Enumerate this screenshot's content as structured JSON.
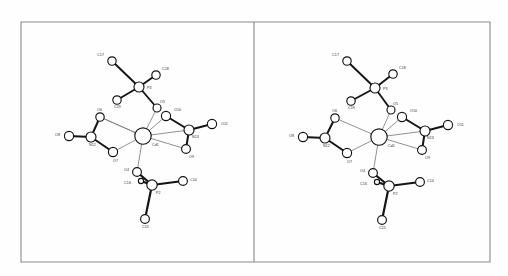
{
  "figure": {
    "kind": "ortep-stereo-pair",
    "title": "",
    "caption": "",
    "background_color": "#fefefe",
    "frame": {
      "stroke_color": "#8a8a8a",
      "x": 21,
      "y": 22,
      "width": 469,
      "height": 240,
      "divider_x": 254
    }
  },
  "chart_data": {
    "type": "diagram",
    "title": "",
    "xlabel": "",
    "ylabel": "",
    "panels": [
      {
        "name": "left-stereo-view",
        "offset_x": 0,
        "atoms": [
          {
            "label": "C17",
            "x": 112,
            "y": 61,
            "r": 4.2,
            "label_dx": -8,
            "label_dy": -5
          },
          {
            "label": "C18",
            "x": 156,
            "y": 75,
            "r": 4.2,
            "label_dx": 6,
            "label_dy": -5
          },
          {
            "label": "C19",
            "x": 117,
            "y": 100,
            "r": 4.2,
            "label_dx": -3,
            "label_dy": 8
          },
          {
            "label": "P3",
            "x": 139,
            "y": 87,
            "r": 5.0,
            "label_dx": 8,
            "label_dy": 2
          },
          {
            "label": "O5",
            "x": 157,
            "y": 108,
            "r": 4.0,
            "label_dx": 3,
            "label_dy": -5
          },
          {
            "label": "O10",
            "x": 166,
            "y": 116,
            "r": 4.6,
            "label_dx": 8,
            "label_dy": -5
          },
          {
            "label": "O11",
            "x": 212,
            "y": 124,
            "r": 4.6,
            "label_dx": 9,
            "label_dy": 1
          },
          {
            "label": "N13",
            "x": 189,
            "y": 130,
            "r": 5.0,
            "label_dx": 3,
            "label_dy": 8
          },
          {
            "label": "O9",
            "x": 186,
            "y": 149,
            "r": 4.4,
            "label_dx": 3,
            "label_dy": 9
          },
          {
            "label": "Cd1",
            "x": 143,
            "y": 136,
            "r": 8.2,
            "label_dx": 9,
            "label_dy": 10
          },
          {
            "label": "O6",
            "x": 100,
            "y": 117,
            "r": 4.2,
            "label_dx": -3,
            "label_dy": -6
          },
          {
            "label": "O8",
            "x": 69,
            "y": 136,
            "r": 4.6,
            "label_dx": -9,
            "label_dy": 0
          },
          {
            "label": "N12",
            "x": 91,
            "y": 137,
            "r": 5.0,
            "label_dx": -2,
            "label_dy": 9
          },
          {
            "label": "O7",
            "x": 113,
            "y": 152,
            "r": 4.6,
            "label_dx": 0,
            "label_dy": 10
          },
          {
            "label": "O4",
            "x": 137,
            "y": 172,
            "r": 4.4,
            "label_dx": -8,
            "label_dy": -1
          },
          {
            "label": "C16",
            "x": 141,
            "y": 181,
            "r": 2.6,
            "label_dx": -10,
            "label_dy": 3
          },
          {
            "label": "P2",
            "x": 152,
            "y": 185,
            "r": 5.2,
            "label_dx": 4,
            "label_dy": 9
          },
          {
            "label": "C14",
            "x": 183,
            "y": 181,
            "r": 4.4,
            "label_dx": 7,
            "label_dy": 0
          },
          {
            "label": "C15",
            "x": 145,
            "y": 219,
            "r": 4.4,
            "label_dx": -3,
            "label_dy": 9
          }
        ],
        "bonds_thick": [
          {
            "a": "C17",
            "b": "P3",
            "w": 1.9
          },
          {
            "a": "C18",
            "b": "P3",
            "w": 1.9
          },
          {
            "a": "C19",
            "b": "P3",
            "w": 1.9
          },
          {
            "a": "P3",
            "b": "O5",
            "w": 1.9
          },
          {
            "a": "O10",
            "b": "N13",
            "w": 2.0
          },
          {
            "a": "N13",
            "b": "O11",
            "w": 2.0
          },
          {
            "a": "N13",
            "b": "O9",
            "w": 2.0
          },
          {
            "a": "O8",
            "b": "N12",
            "w": 2.0
          },
          {
            "a": "N12",
            "b": "O6",
            "w": 2.0
          },
          {
            "a": "N12",
            "b": "O7",
            "w": 2.0
          },
          {
            "a": "O4",
            "b": "P2",
            "w": 2.2
          },
          {
            "a": "C16",
            "b": "P2",
            "w": 2.2
          },
          {
            "a": "P2",
            "b": "C14",
            "w": 2.2
          },
          {
            "a": "P2",
            "b": "C15",
            "w": 2.2
          }
        ],
        "bonds_thin": [
          {
            "a": "Cd1",
            "b": "O5"
          },
          {
            "a": "Cd1",
            "b": "O10"
          },
          {
            "a": "Cd1",
            "b": "N13"
          },
          {
            "a": "Cd1",
            "b": "O9"
          },
          {
            "a": "Cd1",
            "b": "O6"
          },
          {
            "a": "Cd1",
            "b": "O7"
          },
          {
            "a": "Cd1",
            "b": "O4"
          },
          {
            "a": "O6",
            "b": "Cd1"
          }
        ]
      },
      {
        "name": "right-stereo-view",
        "offset_x": 235,
        "atoms": [
          {
            "label": "C17",
            "x": 112,
            "y": 61,
            "r": 4.2,
            "label_dx": -8,
            "label_dy": -5
          },
          {
            "label": "C18",
            "x": 158,
            "y": 74,
            "r": 4.2,
            "label_dx": 6,
            "label_dy": -5
          },
          {
            "label": "C19",
            "x": 116,
            "y": 101,
            "r": 4.2,
            "label_dx": -3,
            "label_dy": 8
          },
          {
            "label": "P3",
            "x": 140,
            "y": 88,
            "r": 5.0,
            "label_dx": 8,
            "label_dy": 2
          },
          {
            "label": "O5",
            "x": 156,
            "y": 110,
            "r": 4.0,
            "label_dx": 2,
            "label_dy": -5
          },
          {
            "label": "O10",
            "x": 167,
            "y": 117,
            "r": 4.6,
            "label_dx": 8,
            "label_dy": -5
          },
          {
            "label": "O11",
            "x": 213,
            "y": 125,
            "r": 4.6,
            "label_dx": 9,
            "label_dy": 1
          },
          {
            "label": "N13",
            "x": 190,
            "y": 131,
            "r": 5.0,
            "label_dx": 2,
            "label_dy": 8
          },
          {
            "label": "O9",
            "x": 187,
            "y": 150,
            "r": 4.4,
            "label_dx": 3,
            "label_dy": 9
          },
          {
            "label": "Cd1",
            "x": 144,
            "y": 137,
            "r": 8.2,
            "label_dx": 9,
            "label_dy": 10
          },
          {
            "label": "O6",
            "x": 100,
            "y": 118,
            "r": 4.2,
            "label_dx": -3,
            "label_dy": -6
          },
          {
            "label": "O8",
            "x": 68,
            "y": 137,
            "r": 4.6,
            "label_dx": -9,
            "label_dy": 0
          },
          {
            "label": "N12",
            "x": 90,
            "y": 138,
            "r": 5.0,
            "label_dx": -2,
            "label_dy": 9
          },
          {
            "label": "O7",
            "x": 112,
            "y": 153,
            "r": 4.6,
            "label_dx": 0,
            "label_dy": 10
          },
          {
            "label": "O4",
            "x": 138,
            "y": 173,
            "r": 4.4,
            "label_dx": -8,
            "label_dy": -1
          },
          {
            "label": "C16",
            "x": 142,
            "y": 182,
            "r": 2.6,
            "label_dx": -10,
            "label_dy": 3
          },
          {
            "label": "P2",
            "x": 154,
            "y": 186,
            "r": 5.2,
            "label_dx": 4,
            "label_dy": 9
          },
          {
            "label": "C14",
            "x": 185,
            "y": 182,
            "r": 4.4,
            "label_dx": 7,
            "label_dy": 0
          },
          {
            "label": "C15",
            "x": 147,
            "y": 220,
            "r": 4.4,
            "label_dx": -3,
            "label_dy": 9
          }
        ],
        "bonds_thick": [
          {
            "a": "C17",
            "b": "P3",
            "w": 1.9
          },
          {
            "a": "C18",
            "b": "P3",
            "w": 1.9
          },
          {
            "a": "C19",
            "b": "P3",
            "w": 1.9
          },
          {
            "a": "P3",
            "b": "O5",
            "w": 1.9
          },
          {
            "a": "O10",
            "b": "N13",
            "w": 2.0
          },
          {
            "a": "N13",
            "b": "O11",
            "w": 2.0
          },
          {
            "a": "N13",
            "b": "O9",
            "w": 2.0
          },
          {
            "a": "O8",
            "b": "N12",
            "w": 2.0
          },
          {
            "a": "N12",
            "b": "O6",
            "w": 2.0
          },
          {
            "a": "N12",
            "b": "O7",
            "w": 2.0
          },
          {
            "a": "O4",
            "b": "P2",
            "w": 2.2
          },
          {
            "a": "C16",
            "b": "P2",
            "w": 2.2
          },
          {
            "a": "P2",
            "b": "C14",
            "w": 2.2
          },
          {
            "a": "P2",
            "b": "C15",
            "w": 2.2
          }
        ],
        "bonds_thin": [
          {
            "a": "Cd1",
            "b": "O5"
          },
          {
            "a": "Cd1",
            "b": "O10"
          },
          {
            "a": "Cd1",
            "b": "N13"
          },
          {
            "a": "Cd1",
            "b": "O9"
          },
          {
            "a": "Cd1",
            "b": "O6"
          },
          {
            "a": "Cd1",
            "b": "O7"
          },
          {
            "a": "Cd1",
            "b": "O4"
          }
        ]
      }
    ]
  }
}
